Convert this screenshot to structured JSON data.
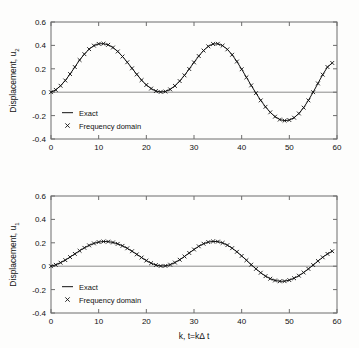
{
  "figure": {
    "background": "#fdfdfc",
    "foreground": "#111111",
    "axis_color": "#6d6d6d"
  },
  "chart_data": [
    {
      "type": "line",
      "title": "",
      "panel": "top",
      "xlabel": "",
      "ylabel": "Displacement, u_2",
      "ylabel_base": "Displacement, u",
      "ylabel_sub": "2",
      "xlim": [
        0,
        60
      ],
      "ylim": [
        -0.4,
        0.6
      ],
      "xticks": [
        0,
        10,
        20,
        30,
        40,
        50,
        60
      ],
      "xticklabels": [
        "0",
        "10",
        "20",
        "30",
        "40",
        "50",
        "60"
      ],
      "yticks": [
        -0.4,
        -0.2,
        0,
        0.2,
        0.4,
        0.6
      ],
      "yticklabels": [
        "-0.4",
        "-0.2",
        "0",
        "0.2",
        "0.4",
        "0.6"
      ],
      "grid": false,
      "legend_position": "lower left inside",
      "legend": [
        {
          "label": "Exact",
          "marker": "line"
        },
        {
          "label": "Frequency domain",
          "marker": "x"
        }
      ],
      "series": [
        {
          "name": "Exact",
          "style": "line",
          "x": [
            0,
            1,
            2,
            3,
            4,
            5,
            6,
            7,
            8,
            9,
            10,
            11,
            12,
            13,
            14,
            15,
            16,
            17,
            18,
            19,
            20,
            21,
            22,
            23,
            24,
            25,
            26,
            27,
            28,
            29,
            30,
            31,
            32,
            33,
            34,
            35,
            36,
            37,
            38,
            39,
            40,
            41,
            42,
            43,
            44,
            45,
            46,
            47,
            48,
            49,
            50,
            51,
            52,
            53,
            54,
            55,
            56,
            57,
            58,
            59
          ],
          "values": [
            0.0,
            0.02,
            0.055,
            0.1,
            0.155,
            0.215,
            0.275,
            0.325,
            0.368,
            0.398,
            0.413,
            0.415,
            0.405,
            0.382,
            0.348,
            0.305,
            0.256,
            0.204,
            0.152,
            0.103,
            0.062,
            0.031,
            0.01,
            0.002,
            0.006,
            0.024,
            0.054,
            0.095,
            0.144,
            0.198,
            0.255,
            0.309,
            0.356,
            0.392,
            0.412,
            0.414,
            0.398,
            0.366,
            0.32,
            0.262,
            0.196,
            0.127,
            0.058,
            -0.008,
            -0.07,
            -0.125,
            -0.172,
            -0.209,
            -0.234,
            -0.243,
            -0.238,
            -0.218,
            -0.182,
            -0.132,
            -0.07,
            0.0,
            0.075,
            0.15,
            0.215,
            0.25
          ]
        },
        {
          "name": "Frequency domain",
          "style": "x",
          "x": [
            0,
            1,
            2,
            3,
            4,
            5,
            6,
            7,
            8,
            9,
            10,
            11,
            12,
            13,
            14,
            15,
            16,
            17,
            18,
            19,
            20,
            21,
            22,
            23,
            24,
            25,
            26,
            27,
            28,
            29,
            30,
            31,
            32,
            33,
            34,
            35,
            36,
            37,
            38,
            39,
            40,
            41,
            42,
            43,
            44,
            45,
            46,
            47,
            48,
            49,
            50,
            51,
            52,
            53,
            54,
            55,
            56,
            57,
            58,
            59
          ],
          "values": [
            0.0,
            0.02,
            0.055,
            0.1,
            0.155,
            0.215,
            0.275,
            0.325,
            0.368,
            0.398,
            0.413,
            0.415,
            0.405,
            0.382,
            0.348,
            0.305,
            0.256,
            0.204,
            0.152,
            0.103,
            0.062,
            0.031,
            0.01,
            0.002,
            0.006,
            0.024,
            0.054,
            0.095,
            0.144,
            0.198,
            0.255,
            0.309,
            0.356,
            0.392,
            0.412,
            0.414,
            0.398,
            0.366,
            0.32,
            0.262,
            0.196,
            0.127,
            0.058,
            -0.008,
            -0.07,
            -0.125,
            -0.172,
            -0.209,
            -0.234,
            -0.243,
            -0.238,
            -0.218,
            -0.182,
            -0.132,
            -0.07,
            0.0,
            0.075,
            0.15,
            0.215,
            0.25
          ]
        }
      ]
    },
    {
      "type": "line",
      "title": "",
      "panel": "bottom",
      "xlabel": "k, t=kΔt",
      "xlabel_parts": [
        "k, t=k",
        "Δ",
        " t"
      ],
      "ylabel": "Displacement, u_1",
      "ylabel_base": "Displacement, u",
      "ylabel_sub": "1",
      "xlim": [
        0,
        60
      ],
      "ylim": [
        -0.4,
        0.6
      ],
      "xticks": [
        0,
        10,
        20,
        30,
        40,
        50,
        60
      ],
      "xticklabels": [
        "0",
        "10",
        "20",
        "30",
        "40",
        "50",
        "60"
      ],
      "yticks": [
        -0.4,
        -0.2,
        0,
        0.2,
        0.4,
        0.6
      ],
      "yticklabels": [
        "-0.4",
        "-0.2",
        "0",
        "0.2",
        "0.4",
        "0.6"
      ],
      "grid": false,
      "legend_position": "lower left inside",
      "legend": [
        {
          "label": "Exact",
          "marker": "line"
        },
        {
          "label": "Frequency domain",
          "marker": "x"
        }
      ],
      "series": [
        {
          "name": "Exact",
          "style": "line",
          "x": [
            0,
            1,
            2,
            3,
            4,
            5,
            6,
            7,
            8,
            9,
            10,
            11,
            12,
            13,
            14,
            15,
            16,
            17,
            18,
            19,
            20,
            21,
            22,
            23,
            24,
            25,
            26,
            27,
            28,
            29,
            30,
            31,
            32,
            33,
            34,
            35,
            36,
            37,
            38,
            39,
            40,
            41,
            42,
            43,
            44,
            45,
            46,
            47,
            48,
            49,
            50,
            51,
            52,
            53,
            54,
            55,
            56,
            57,
            58,
            59
          ],
          "values": [
            0.0,
            0.012,
            0.03,
            0.052,
            0.078,
            0.105,
            0.132,
            0.157,
            0.178,
            0.195,
            0.206,
            0.211,
            0.21,
            0.203,
            0.191,
            0.174,
            0.153,
            0.128,
            0.101,
            0.074,
            0.048,
            0.026,
            0.01,
            0.002,
            0.003,
            0.013,
            0.031,
            0.055,
            0.083,
            0.113,
            0.143,
            0.17,
            0.192,
            0.206,
            0.212,
            0.21,
            0.199,
            0.18,
            0.154,
            0.123,
            0.088,
            0.051,
            0.013,
            -0.023,
            -0.056,
            -0.085,
            -0.107,
            -0.122,
            -0.129,
            -0.128,
            -0.119,
            -0.103,
            -0.081,
            -0.054,
            -0.023,
            0.01,
            0.044,
            0.076,
            0.105,
            0.128
          ]
        },
        {
          "name": "Frequency domain",
          "style": "x",
          "x": [
            0,
            1,
            2,
            3,
            4,
            5,
            6,
            7,
            8,
            9,
            10,
            11,
            12,
            13,
            14,
            15,
            16,
            17,
            18,
            19,
            20,
            21,
            22,
            23,
            24,
            25,
            26,
            27,
            28,
            29,
            30,
            31,
            32,
            33,
            34,
            35,
            36,
            37,
            38,
            39,
            40,
            41,
            42,
            43,
            44,
            45,
            46,
            47,
            48,
            49,
            50,
            51,
            52,
            53,
            54,
            55,
            56,
            57,
            58,
            59
          ],
          "values": [
            0.0,
            0.012,
            0.03,
            0.052,
            0.078,
            0.105,
            0.132,
            0.157,
            0.178,
            0.195,
            0.206,
            0.211,
            0.21,
            0.203,
            0.191,
            0.174,
            0.153,
            0.128,
            0.101,
            0.074,
            0.048,
            0.026,
            0.01,
            0.002,
            0.003,
            0.013,
            0.031,
            0.055,
            0.083,
            0.113,
            0.143,
            0.17,
            0.192,
            0.206,
            0.212,
            0.21,
            0.199,
            0.18,
            0.154,
            0.123,
            0.088,
            0.051,
            0.013,
            -0.023,
            -0.056,
            -0.085,
            -0.107,
            -0.122,
            -0.129,
            -0.128,
            -0.119,
            -0.103,
            -0.081,
            -0.054,
            -0.023,
            0.01,
            0.044,
            0.076,
            0.105,
            0.128
          ]
        }
      ]
    }
  ]
}
